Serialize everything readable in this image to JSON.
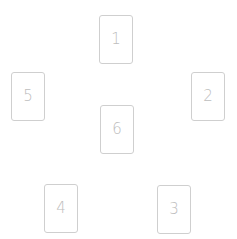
{
  "spread": {
    "cards": [
      {
        "label": "1",
        "x": 99,
        "y": 15
      },
      {
        "label": "2",
        "x": 191,
        "y": 72
      },
      {
        "label": "3",
        "x": 157,
        "y": 185
      },
      {
        "label": "4",
        "x": 44,
        "y": 184
      },
      {
        "label": "5",
        "x": 11,
        "y": 72
      },
      {
        "label": "6",
        "x": 100,
        "y": 105
      }
    ]
  },
  "colors": {
    "background": "#ffffff",
    "card_border": "#cfcfcf",
    "card_number": "#bdbdbd"
  }
}
